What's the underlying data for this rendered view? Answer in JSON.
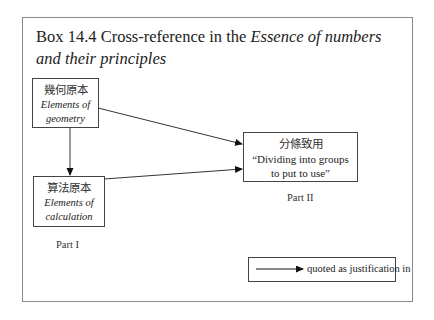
{
  "figure": {
    "title_prefix": "Box 14.4 Cross-reference in the ",
    "title_italic": "Essence of numbers and their principles"
  },
  "nodes": [
    {
      "id": "elements-of-geometry",
      "zh": "幾何原本",
      "en_line1": "Elements of",
      "en_line2": "geometry"
    },
    {
      "id": "elements-of-calculation",
      "zh": "算法原本",
      "en_line1": "Elements of",
      "en_line2": "calculation"
    },
    {
      "id": "dividing-into-groups",
      "zh": "分條致用",
      "en_line1": "“Dividing into groups",
      "en_line2": "to put to use”"
    }
  ],
  "parts": {
    "part1": "Part I",
    "part2": "Part II"
  },
  "edges": [
    {
      "from": "elements-of-geometry",
      "to": "elements-of-calculation"
    },
    {
      "from": "elements-of-geometry",
      "to": "dividing-into-groups"
    },
    {
      "from": "elements-of-calculation",
      "to": "dividing-into-groups"
    }
  ],
  "legend": {
    "label": "quoted as justification in"
  }
}
